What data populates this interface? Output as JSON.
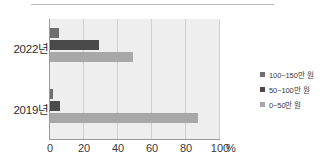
{
  "chart_data": {
    "type": "bar",
    "orientation": "horizontal",
    "title": "",
    "xlabel": "%",
    "ylabel": "",
    "categories": [
      "2022년",
      "2019년"
    ],
    "series": [
      {
        "name": "100~150만 원",
        "color": "#6e6e6e",
        "values": [
          5,
          2
        ]
      },
      {
        "name": "50~100만 원",
        "color": "#4a4a4a",
        "values": [
          29,
          6
        ]
      },
      {
        "name": "0~50만 원",
        "color": "#a8a8a8",
        "values": [
          49,
          87
        ]
      }
    ],
    "xlim": [
      0,
      110
    ],
    "xticks": [
      0,
      20,
      40,
      60,
      80,
      100
    ],
    "xticklabels": [
      "0",
      "20",
      "40",
      "60",
      "80",
      "100"
    ],
    "unit_label": "%",
    "grid": true,
    "grid_axis": "x",
    "legend_position": "right",
    "plot_background": "#eeeeee"
  },
  "legend": {
    "items": [
      {
        "label": "100~150만 원",
        "color": "#6e6e6e"
      },
      {
        "label": "50~100만 원",
        "color": "#4a4a4a"
      },
      {
        "label": "0~50만 원",
        "color": "#a8a8a8"
      }
    ]
  },
  "axis": {
    "y_categories": [
      "2022년",
      "2019년"
    ],
    "x_ticks": [
      "0",
      "20",
      "40",
      "60",
      "80",
      "100"
    ],
    "x_unit": "%"
  }
}
